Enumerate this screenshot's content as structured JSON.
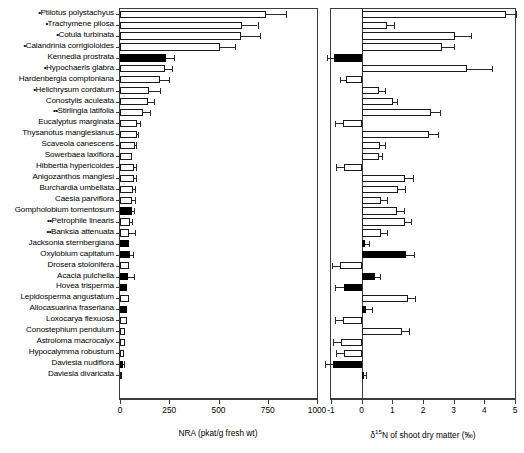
{
  "chart_data": {
    "type": "bar",
    "title": "",
    "orientation": "horizontal",
    "grid": false,
    "legend": null,
    "panels": [
      {
        "id": "panel-a",
        "xlabel": "NRA (pkat/g fresh wt)",
        "xlim": [
          0,
          1000
        ],
        "xticks": [
          0,
          250,
          500,
          750,
          1000
        ],
        "xticklabels": [
          "0",
          "250",
          "500",
          "750",
          "1000"
        ]
      },
      {
        "id": "panel-b",
        "xlabel": "δ 15N of shoot dry matter (‰)",
        "xlabel_parts": {
          "pre": "δ",
          "sup": "15",
          "post": "N of shoot dry matter (‰)"
        },
        "xlim": [
          -1,
          5
        ],
        "xticks": [
          -1,
          0,
          1,
          2,
          3,
          4,
          5
        ],
        "xticklabels": [
          "-1",
          "0",
          "1",
          "2",
          "3",
          "4",
          "5"
        ]
      }
    ],
    "categories": [
      "•Ptilotus polystachyus",
      "•Trachymene pilosa",
      "•Cotula turbinata",
      "•Calandrinia corrigioloides",
      "Kennedia prostrata",
      "•Hypochaeris glabra",
      "Hardenbergia comptoniana",
      "•Helichrysum cordatum",
      "Conostylis aculeata",
      "••Stirlingia latifolia",
      "Eucalyptus marginata",
      "Thysanotus manglesianus",
      "Scaveola canescens",
      "Sowerbaea laxiflora",
      "Hibbertia hypericoides",
      "Anigozanthos manglesi",
      "Burchardia umbellata",
      "Caesia parviflora",
      "Gompholobium tomentosum",
      "••Petrophile linearis",
      "••Banksia attenuata",
      "Jacksonia sternbergiana",
      "Oxylobium capitatum",
      "Drosera stolonifera",
      "Acacia pulchella",
      "Hovea trisperma",
      "Lepidosperma angustatum",
      "Allocasuarina fraseriana",
      "Loxocarya flexuosa",
      "Conostephium pendulum",
      "Astroloma macrocalyx",
      "Hypocalymma robustum",
      "Daviesia nudiflora",
      "Daviesia divaricata"
    ],
    "series": [
      {
        "name": "NRA (pkat/g fresh wt)",
        "panel": "panel-a",
        "unit": "pkat/g fresh wt",
        "values": [
          740,
          620,
          615,
          510,
          232,
          228,
          205,
          148,
          140,
          118,
          84,
          84,
          76,
          60,
          70,
          70,
          66,
          62,
          60,
          52,
          46,
          46,
          52,
          44,
          40,
          38,
          44,
          38,
          36,
          26,
          24,
          22,
          14,
          8
        ],
        "errors": [
          105,
          78,
          95,
          73,
          40,
          38,
          42,
          56,
          32,
          35,
          15,
          8,
          6,
          0,
          10,
          10,
          12,
          12,
          12,
          10,
          30,
          0,
          14,
          0,
          30,
          0,
          0,
          0,
          0,
          0,
          0,
          0,
          5,
          0
        ],
        "fill": [
          "open",
          "open",
          "open",
          "open",
          "solid",
          "open",
          "open",
          "open",
          "open",
          "open",
          "open",
          "open",
          "open",
          "open",
          "open",
          "open",
          "open",
          "open",
          "solid",
          "open",
          "open",
          "solid",
          "solid",
          "open",
          "solid",
          "solid",
          "open",
          "solid",
          "open",
          "open",
          "open",
          "open",
          "solid",
          "open"
        ]
      },
      {
        "name": "δ15N of shoot dry matter (‰)",
        "panel": "panel-b",
        "unit": "‰",
        "values": [
          4.72,
          0.82,
          3.05,
          2.62,
          -0.9,
          3.42,
          -0.52,
          0.55,
          1.02,
          2.25,
          -0.62,
          2.2,
          0.6,
          0.55,
          -0.58,
          1.42,
          1.18,
          0.62,
          1.15,
          1.4,
          0.62,
          0.1,
          1.45,
          -0.7,
          0.42,
          -0.58,
          1.5,
          0.15,
          -0.62,
          1.32,
          -0.66,
          -0.58,
          -0.92,
          0.05
        ],
        "errors": [
          0.3,
          0.22,
          0.52,
          0.38,
          0.22,
          0.82,
          0.2,
          0.22,
          0.12,
          0.32,
          0.25,
          0.28,
          0.15,
          0.12,
          0.25,
          0.25,
          0.22,
          0.2,
          0.22,
          0.22,
          0.2,
          0.15,
          0.25,
          0.28,
          0.18,
          0.28,
          0.25,
          0.18,
          0.25,
          0.22,
          0.28,
          0.25,
          0.28,
          0.1
        ],
        "fill": [
          "open",
          "open",
          "open",
          "open",
          "solid",
          "open",
          "open",
          "open",
          "open",
          "open",
          "open",
          "open",
          "open",
          "open",
          "open",
          "open",
          "open",
          "open",
          "open",
          "open",
          "open",
          "solid",
          "solid",
          "open",
          "solid",
          "solid",
          "open",
          "solid",
          "open",
          "open",
          "open",
          "open",
          "solid",
          "solid"
        ]
      }
    ]
  }
}
